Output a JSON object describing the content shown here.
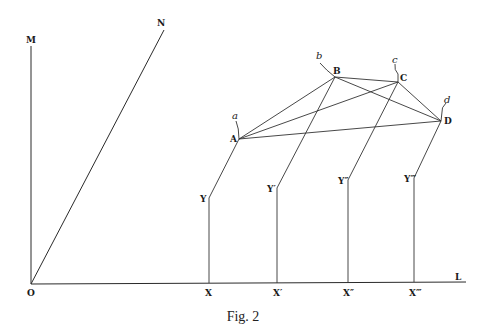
{
  "figure": {
    "caption": "Fig. 2",
    "axis_labels": {
      "origin": "O",
      "vertical": "M",
      "oblique": "N",
      "horizontal": "L"
    },
    "points": {
      "A": "A",
      "B": "B",
      "C": "C",
      "D": "D"
    },
    "small_labels": {
      "a": "a",
      "b": "b",
      "c": "c",
      "d": "d"
    },
    "x_labels": [
      "X",
      "X′",
      "X″",
      "X‴"
    ],
    "y_labels": [
      "Y",
      "Y′",
      "Y″",
      "Y‴"
    ]
  }
}
